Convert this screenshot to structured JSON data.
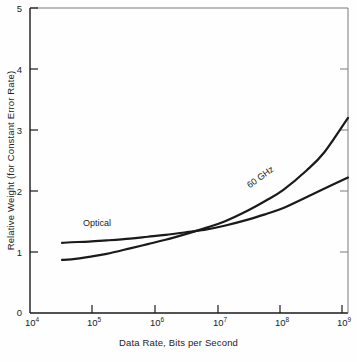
{
  "chart_data": {
    "type": "line",
    "title": "",
    "xlabel": "Data Rate, Bits per Second",
    "ylabel": "Relative Weight (for Constant Error Rate)",
    "xscale": "log",
    "yscale": "linear",
    "xlim": [
      10000,
      2500000000
    ],
    "ylim": [
      0,
      5
    ],
    "grid": false,
    "legend_position": "inline-curve-labels",
    "xticks": [
      {
        "value": 10000,
        "label": "10",
        "exponent": "4"
      },
      {
        "value": 100000,
        "label": "10",
        "exponent": "5"
      },
      {
        "value": 1000000,
        "label": "10",
        "exponent": "6"
      },
      {
        "value": 10000000,
        "label": "10",
        "exponent": "7"
      },
      {
        "value": 100000000,
        "label": "10",
        "exponent": "8"
      },
      {
        "value": 1000000000,
        "label": "10",
        "exponent": "9"
      }
    ],
    "yticks": [
      {
        "value": 0,
        "label": "0"
      },
      {
        "value": 1,
        "label": "1"
      },
      {
        "value": 2,
        "label": "2"
      },
      {
        "value": 3,
        "label": "3"
      },
      {
        "value": 4,
        "label": "4"
      },
      {
        "value": 5,
        "label": "5"
      }
    ],
    "series": [
      {
        "name": "Optical",
        "label": "Optical",
        "color": "#1a1a1a",
        "x": [
          35000,
          50000,
          100000,
          200000,
          500000,
          1000000,
          2000000,
          5000000,
          10000000,
          20000000,
          50000000,
          100000000,
          200000000,
          500000000,
          1000000000,
          2500000000
        ],
        "y": [
          1.15,
          1.16,
          1.17,
          1.19,
          1.22,
          1.25,
          1.28,
          1.33,
          1.37,
          1.43,
          1.53,
          1.62,
          1.72,
          1.9,
          2.04,
          2.22
        ]
      },
      {
        "name": "60 GHz",
        "label": "60 GHz",
        "color": "#1a1a1a",
        "x": [
          35000,
          50000,
          100000,
          200000,
          500000,
          1000000,
          2000000,
          5000000,
          10000000,
          20000000,
          50000000,
          100000000,
          200000000,
          500000000,
          1000000000,
          2500000000
        ],
        "y": [
          0.87,
          0.88,
          0.92,
          0.97,
          1.06,
          1.13,
          1.2,
          1.31,
          1.4,
          1.5,
          1.68,
          1.84,
          2.02,
          2.34,
          2.64,
          3.2
        ]
      }
    ],
    "annotations": [
      {
        "text": "Optical",
        "series": "Optical",
        "placement": "above-curve-left"
      },
      {
        "text": "60 GHz",
        "series": "60 GHz",
        "placement": "along-curve-right",
        "rotation_deg": -36
      }
    ],
    "crossing_point": {
      "x": 20000000,
      "y": 1.45
    }
  }
}
